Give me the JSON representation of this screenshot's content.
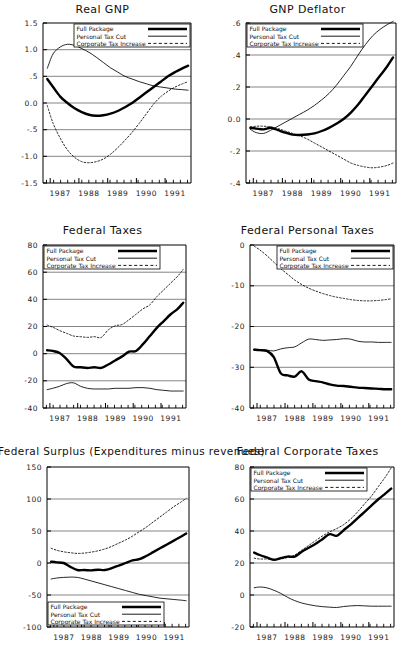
{
  "figure": {
    "background": "#ffffff",
    "frame_color": "#000000",
    "grid_color": "#777777"
  },
  "legend": {
    "entries": [
      {
        "label": "Full Package",
        "style": "thick-solid",
        "color": "#000000"
      },
      {
        "label": "Personal Tax Cut",
        "style": "thin-solid",
        "color": "#000000"
      },
      {
        "label": "Corporate Tax Increase",
        "style": "dotted",
        "color": "#000000"
      }
    ]
  },
  "x_tick_labels": [
    "1987",
    "1988",
    "1989",
    "1990",
    "1991"
  ],
  "chart_data": [
    {
      "id": "real-gnp",
      "type": "line",
      "title": "Real GNP",
      "xlabel": "",
      "ylabel": "",
      "xlim": [
        1986.75,
        1991.9
      ],
      "ylim": [
        -1.5,
        1.5
      ],
      "ytick_labels": [
        "1.5",
        "1.0",
        ".5",
        "0.0",
        "-.5",
        "-1.0",
        "-1.5"
      ],
      "yticks": [
        1.5,
        1.0,
        0.5,
        0.0,
        -0.5,
        -1.0,
        -1.5
      ],
      "grid": true,
      "legend_position": "top-right-inside",
      "x": [
        1986.9,
        1987.1,
        1987.35,
        1987.6,
        1987.85,
        1988.1,
        1988.35,
        1988.6,
        1988.85,
        1989.1,
        1989.35,
        1989.6,
        1989.85,
        1990.1,
        1990.35,
        1990.6,
        1990.85,
        1991.1,
        1991.35,
        1991.6,
        1991.8
      ],
      "series": [
        {
          "name": "Full Package",
          "style": "thick-solid",
          "values": [
            0.45,
            0.3,
            0.12,
            0.0,
            -0.1,
            -0.17,
            -0.22,
            -0.24,
            -0.23,
            -0.2,
            -0.15,
            -0.08,
            0.0,
            0.1,
            0.2,
            0.3,
            0.4,
            0.5,
            0.58,
            0.65,
            0.7
          ]
        },
        {
          "name": "Personal Tax Cut",
          "style": "thin-solid",
          "values": [
            0.65,
            0.92,
            1.05,
            1.1,
            1.08,
            1.02,
            0.95,
            0.86,
            0.76,
            0.66,
            0.58,
            0.5,
            0.45,
            0.4,
            0.36,
            0.32,
            0.3,
            0.28,
            0.26,
            0.25,
            0.24
          ]
        },
        {
          "name": "Corporate Tax Increase",
          "style": "dotted",
          "values": [
            -0.05,
            -0.38,
            -0.66,
            -0.88,
            -1.02,
            -1.1,
            -1.12,
            -1.1,
            -1.05,
            -0.96,
            -0.84,
            -0.7,
            -0.55,
            -0.38,
            -0.2,
            -0.02,
            0.12,
            0.22,
            0.3,
            0.36,
            0.4
          ]
        }
      ]
    },
    {
      "id": "gnp-deflator",
      "type": "line",
      "title": "GNP Deflator",
      "xlabel": "",
      "ylabel": "",
      "xlim": [
        1986.75,
        1991.9
      ],
      "ylim": [
        -0.4,
        0.6
      ],
      "ytick_labels": [
        ".6",
        ".4",
        ".2",
        "0.0",
        "-.2",
        "-.4"
      ],
      "yticks": [
        0.6,
        0.4,
        0.2,
        0.0,
        -0.2,
        -0.4
      ],
      "grid": true,
      "legend_position": "top-left-inside",
      "x": [
        1986.9,
        1987.1,
        1987.35,
        1987.6,
        1987.85,
        1988.1,
        1988.35,
        1988.6,
        1988.85,
        1989.1,
        1989.35,
        1989.6,
        1989.85,
        1990.1,
        1990.35,
        1990.6,
        1990.85,
        1991.1,
        1991.35,
        1991.6,
        1991.8
      ],
      "series": [
        {
          "name": "Full Package",
          "style": "thick-solid",
          "values": [
            -0.055,
            -0.06,
            -0.065,
            -0.055,
            -0.07,
            -0.085,
            -0.098,
            -0.1,
            -0.097,
            -0.09,
            -0.075,
            -0.055,
            -0.03,
            0.0,
            0.04,
            0.09,
            0.15,
            0.21,
            0.27,
            0.33,
            0.385
          ]
        },
        {
          "name": "Personal Tax Cut",
          "style": "thin-solid",
          "values": [
            -0.065,
            -0.085,
            -0.09,
            -0.07,
            -0.045,
            -0.02,
            0.005,
            0.03,
            0.055,
            0.085,
            0.12,
            0.16,
            0.21,
            0.27,
            0.33,
            0.4,
            0.465,
            0.52,
            0.56,
            0.59,
            0.61
          ]
        },
        {
          "name": "Corporate Tax Increase",
          "style": "dotted",
          "values": [
            -0.05,
            -0.045,
            -0.045,
            -0.05,
            -0.06,
            -0.075,
            -0.09,
            -0.105,
            -0.125,
            -0.15,
            -0.175,
            -0.2,
            -0.225,
            -0.25,
            -0.275,
            -0.29,
            -0.3,
            -0.305,
            -0.3,
            -0.29,
            -0.275
          ]
        }
      ]
    },
    {
      "id": "federal-taxes",
      "type": "line",
      "title": "Federal Taxes",
      "xlabel": "",
      "ylabel": "",
      "xlim": [
        1986.75,
        1991.9
      ],
      "ylim": [
        -40,
        80
      ],
      "ytick_labels": [
        "80",
        "60",
        "40",
        "20",
        "0",
        "-20",
        "-40"
      ],
      "yticks": [
        80,
        60,
        40,
        20,
        0,
        -20,
        -40
      ],
      "grid": true,
      "legend_position": "top-left-inside",
      "x": [
        1986.9,
        1987.1,
        1987.35,
        1987.6,
        1987.85,
        1988.1,
        1988.35,
        1988.6,
        1988.85,
        1989.1,
        1989.35,
        1989.6,
        1989.85,
        1990.1,
        1990.35,
        1990.6,
        1990.85,
        1991.1,
        1991.35,
        1991.6,
        1991.8
      ],
      "series": [
        {
          "name": "Full Package",
          "style": "thick-solid",
          "values": [
            2.5,
            2.0,
            0.5,
            -4.0,
            -9.5,
            -10.0,
            -10.5,
            -10.0,
            -10.5,
            -8.0,
            -5.0,
            -2.0,
            1.5,
            2.0,
            7.0,
            13.0,
            19.0,
            24.0,
            29.0,
            33.0,
            37.5
          ]
        },
        {
          "name": "Personal Tax Cut",
          "style": "thin-solid",
          "values": [
            -26.5,
            -25.5,
            -24.0,
            -22.0,
            -21.5,
            -24.0,
            -25.5,
            -26.0,
            -26.0,
            -26.0,
            -25.5,
            -25.5,
            -25.5,
            -25.0,
            -25.0,
            -25.5,
            -26.5,
            -27.0,
            -27.5,
            -27.5,
            -27.5
          ]
        },
        {
          "name": "Corporate Tax Increase",
          "style": "dotted",
          "values": [
            21.0,
            19.5,
            17.0,
            15.0,
            13.0,
            12.5,
            12.0,
            12.5,
            12.0,
            17.5,
            20.5,
            21.5,
            25.0,
            29.0,
            33.0,
            36.0,
            42.0,
            47.0,
            52.0,
            57.0,
            62.0
          ]
        }
      ]
    },
    {
      "id": "federal-personal-taxes",
      "type": "line",
      "title": "Federal Personal Taxes",
      "xlabel": "",
      "ylabel": "",
      "xlim": [
        1986.75,
        1991.9
      ],
      "ylim": [
        -40,
        0
      ],
      "ytick_labels": [
        "0",
        "-10",
        "-20",
        "-30",
        "-40"
      ],
      "yticks": [
        0,
        -10,
        -20,
        -30,
        -40
      ],
      "grid": true,
      "legend_position": "top-right-inside",
      "x": [
        1986.9,
        1987.1,
        1987.35,
        1987.6,
        1987.85,
        1988.1,
        1988.35,
        1988.6,
        1988.85,
        1989.1,
        1989.35,
        1989.6,
        1989.85,
        1990.1,
        1990.35,
        1990.6,
        1990.85,
        1991.1,
        1991.35,
        1991.6,
        1991.8
      ],
      "series": [
        {
          "name": "Full Package",
          "style": "thick-solid",
          "values": [
            -25.7,
            -25.8,
            -26.0,
            -27.5,
            -31.5,
            -32.0,
            -32.3,
            -31.0,
            -33.0,
            -33.4,
            -33.7,
            -34.2,
            -34.5,
            -34.6,
            -34.8,
            -35.0,
            -35.1,
            -35.2,
            -35.3,
            -35.4,
            -35.4
          ]
        },
        {
          "name": "Personal Tax Cut",
          "style": "thin-solid",
          "values": [
            -25.6,
            -25.7,
            -25.8,
            -26.0,
            -25.5,
            -25.2,
            -25.0,
            -24.0,
            -23.1,
            -23.2,
            -23.4,
            -23.3,
            -23.2,
            -23.0,
            -23.1,
            -23.6,
            -23.8,
            -23.8,
            -23.9,
            -23.9,
            -23.9
          ]
        },
        {
          "name": "Corporate Tax Increase",
          "style": "dotted",
          "values": [
            -0.3,
            -1.2,
            -2.6,
            -4.2,
            -5.8,
            -7.2,
            -8.6,
            -9.7,
            -10.6,
            -11.3,
            -11.9,
            -12.4,
            -12.8,
            -13.1,
            -13.4,
            -13.6,
            -13.7,
            -13.7,
            -13.6,
            -13.4,
            -13.2
          ]
        }
      ]
    },
    {
      "id": "federal-surplus",
      "type": "line",
      "title": "Federal Surplus (Expenditures minus revenues)",
      "xlabel": "",
      "ylabel": "",
      "xlim": [
        1986.75,
        1991.9
      ],
      "ylim": [
        -100,
        150
      ],
      "ytick_labels": [
        "150",
        "100",
        "50",
        "0",
        "-50",
        "-100"
      ],
      "yticks": [
        150,
        100,
        50,
        0,
        -50,
        -100
      ],
      "grid": true,
      "legend_position": "bottom-left-inside",
      "x": [
        1986.9,
        1987.1,
        1987.35,
        1987.6,
        1987.85,
        1988.1,
        1988.35,
        1988.6,
        1988.85,
        1989.1,
        1989.35,
        1989.6,
        1989.85,
        1990.1,
        1990.35,
        1990.6,
        1990.85,
        1991.1,
        1991.35,
        1991.6,
        1991.8
      ],
      "series": [
        {
          "name": "Full Package",
          "style": "thick-solid",
          "values": [
            2.0,
            1.0,
            0.0,
            -6.0,
            -11.0,
            -11.0,
            -11.5,
            -10.5,
            -11.0,
            -8.0,
            -4.0,
            0.0,
            4.0,
            6.0,
            11.0,
            17.0,
            23.0,
            29.0,
            35.0,
            41.0,
            46.0
          ]
        },
        {
          "name": "Personal Tax Cut",
          "style": "thin-solid",
          "values": [
            -25.0,
            -23.5,
            -22.5,
            -22.0,
            -22.5,
            -25.0,
            -28.0,
            -31.0,
            -34.0,
            -37.0,
            -40.0,
            -43.0,
            -46.0,
            -49.0,
            -51.0,
            -53.0,
            -55.0,
            -56.0,
            -57.0,
            -58.0,
            -59.0
          ]
        },
        {
          "name": "Corporate Tax Increase",
          "style": "dotted",
          "values": [
            23.0,
            20.0,
            17.5,
            16.0,
            15.0,
            15.5,
            17.0,
            19.0,
            22.0,
            26.0,
            31.0,
            36.0,
            42.0,
            49.0,
            56.0,
            64.0,
            72.0,
            80.0,
            88.0,
            95.0,
            101.0
          ]
        }
      ]
    },
    {
      "id": "federal-corporate-taxes",
      "type": "line",
      "title": "Federal Corporate Taxes",
      "xlabel": "",
      "ylabel": "",
      "xlim": [
        1986.75,
        1991.9
      ],
      "ylim": [
        -20,
        80
      ],
      "ytick_labels": [
        "80",
        "60",
        "40",
        "20",
        "0",
        "-20"
      ],
      "yticks": [
        80,
        60,
        40,
        20,
        0,
        -20
      ],
      "grid": true,
      "legend_position": "top-left-inside",
      "x": [
        1986.9,
        1987.1,
        1987.35,
        1987.6,
        1987.85,
        1988.1,
        1988.35,
        1988.6,
        1988.85,
        1989.1,
        1989.35,
        1989.6,
        1989.85,
        1990.1,
        1990.35,
        1990.6,
        1990.85,
        1991.1,
        1991.35,
        1991.6,
        1991.8
      ],
      "series": [
        {
          "name": "Full Package",
          "style": "thick-solid",
          "values": [
            26.5,
            25.0,
            23.5,
            22.0,
            23.0,
            24.0,
            24.0,
            27.0,
            29.5,
            32.0,
            35.0,
            38.0,
            37.0,
            40.5,
            44.0,
            48.0,
            52.0,
            56.0,
            60.0,
            63.5,
            66.5
          ]
        },
        {
          "name": "Personal Tax Cut",
          "style": "thin-solid",
          "values": [
            4.5,
            5.0,
            4.5,
            3.0,
            1.0,
            -1.5,
            -3.5,
            -5.0,
            -6.0,
            -6.8,
            -7.3,
            -7.6,
            -7.8,
            -7.2,
            -6.8,
            -6.6,
            -6.8,
            -7.0,
            -7.0,
            -7.0,
            -7.0
          ]
        },
        {
          "name": "Corporate Tax Increase",
          "style": "dotted",
          "values": [
            23.0,
            22.5,
            22.5,
            22.0,
            22.5,
            23.5,
            25.0,
            28.0,
            31.0,
            34.0,
            37.0,
            39.5,
            41.5,
            44.0,
            47.5,
            52.0,
            57.0,
            62.0,
            68.0,
            74.0,
            79.5
          ]
        }
      ]
    }
  ]
}
